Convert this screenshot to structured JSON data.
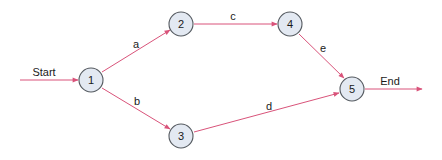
{
  "diagram": {
    "type": "network",
    "accent_color": "#d9537a",
    "node_fill": "#e3e9f2",
    "nodes": [
      {
        "id": "1",
        "label": "1",
        "x": 91,
        "y": 80
      },
      {
        "id": "2",
        "label": "2",
        "x": 181,
        "y": 24
      },
      {
        "id": "3",
        "label": "3",
        "x": 181,
        "y": 136
      },
      {
        "id": "4",
        "label": "4",
        "x": 290,
        "y": 24
      },
      {
        "id": "5",
        "label": "5",
        "x": 352,
        "y": 89
      }
    ],
    "edges": [
      {
        "from": "start",
        "to": "1",
        "label": "Start"
      },
      {
        "from": "1",
        "to": "2",
        "label": "a"
      },
      {
        "from": "1",
        "to": "3",
        "label": "b"
      },
      {
        "from": "2",
        "to": "4",
        "label": "c"
      },
      {
        "from": "3",
        "to": "5",
        "label": "d"
      },
      {
        "from": "4",
        "to": "5",
        "label": "e"
      },
      {
        "from": "5",
        "to": "end",
        "label": "End"
      }
    ]
  }
}
